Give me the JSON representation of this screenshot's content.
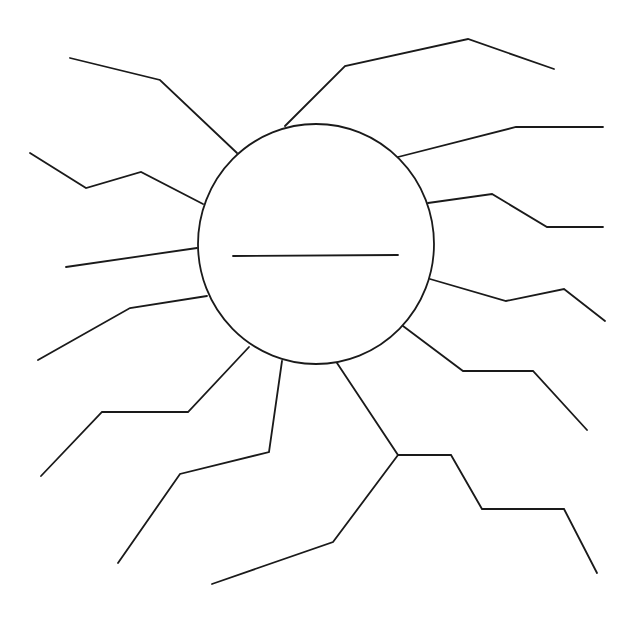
{
  "diagram": {
    "type": "sunburst-graphic-organizer",
    "canvas": {
      "width": 638,
      "height": 623,
      "background": "#ffffff"
    },
    "stroke_color": "#1a1a1a",
    "stroke_width": 1.8,
    "center": {
      "shape": "ellipse",
      "cx": 316,
      "cy": 244,
      "rx": 118,
      "ry": 120,
      "label": "",
      "blank_line": {
        "x1": 233,
        "y1": 256,
        "x2": 398,
        "y2": 255
      }
    },
    "rays": [
      {
        "id": "ray-1",
        "label": "",
        "points": [
          [
            237,
            153
          ],
          [
            160,
            80
          ],
          [
            70,
            58
          ]
        ]
      },
      {
        "id": "ray-2",
        "label": "",
        "points": [
          [
            285,
            126
          ],
          [
            345,
            66
          ],
          [
            468,
            39
          ],
          [
            554,
            69
          ]
        ]
      },
      {
        "id": "ray-3",
        "label": "",
        "points": [
          [
            398,
            157
          ],
          [
            516,
            127
          ],
          [
            603,
            127
          ]
        ]
      },
      {
        "id": "ray-4",
        "label": "",
        "points": [
          [
            428,
            203
          ],
          [
            492,
            194
          ],
          [
            547,
            227
          ],
          [
            603,
            227
          ]
        ]
      },
      {
        "id": "ray-5",
        "label": "",
        "points": [
          [
            430,
            279
          ],
          [
            506,
            301
          ],
          [
            564,
            289
          ],
          [
            605,
            321
          ]
        ]
      },
      {
        "id": "ray-6",
        "label": "",
        "points": [
          [
            403,
            326
          ],
          [
            463,
            371
          ],
          [
            533,
            371
          ],
          [
            587,
            430
          ]
        ]
      },
      {
        "id": "ray-7",
        "label": "",
        "points": [
          [
            337,
            363
          ],
          [
            398,
            455
          ],
          [
            451,
            455
          ],
          [
            482,
            509
          ],
          [
            564,
            509
          ],
          [
            597,
            573
          ]
        ]
      },
      {
        "id": "ray-8",
        "label": "",
        "points": [
          [
            398,
            455
          ],
          [
            333,
            542
          ],
          [
            212,
            584
          ]
        ]
      },
      {
        "id": "ray-9",
        "label": "",
        "points": [
          [
            282,
            361
          ],
          [
            269,
            452
          ],
          [
            180,
            474
          ],
          [
            118,
            563
          ]
        ]
      },
      {
        "id": "ray-10",
        "label": "",
        "points": [
          [
            249,
            347
          ],
          [
            188,
            412
          ],
          [
            102,
            412
          ],
          [
            41,
            476
          ]
        ]
      },
      {
        "id": "ray-11",
        "label": "",
        "points": [
          [
            207,
            296
          ],
          [
            130,
            308
          ],
          [
            38,
            360
          ]
        ]
      },
      {
        "id": "ray-12",
        "label": "",
        "points": [
          [
            197,
            248
          ],
          [
            66,
            267
          ]
        ]
      },
      {
        "id": "ray-13",
        "label": "",
        "points": [
          [
            203,
            204
          ],
          [
            141,
            172
          ],
          [
            86,
            188
          ],
          [
            30,
            153
          ]
        ]
      }
    ]
  }
}
